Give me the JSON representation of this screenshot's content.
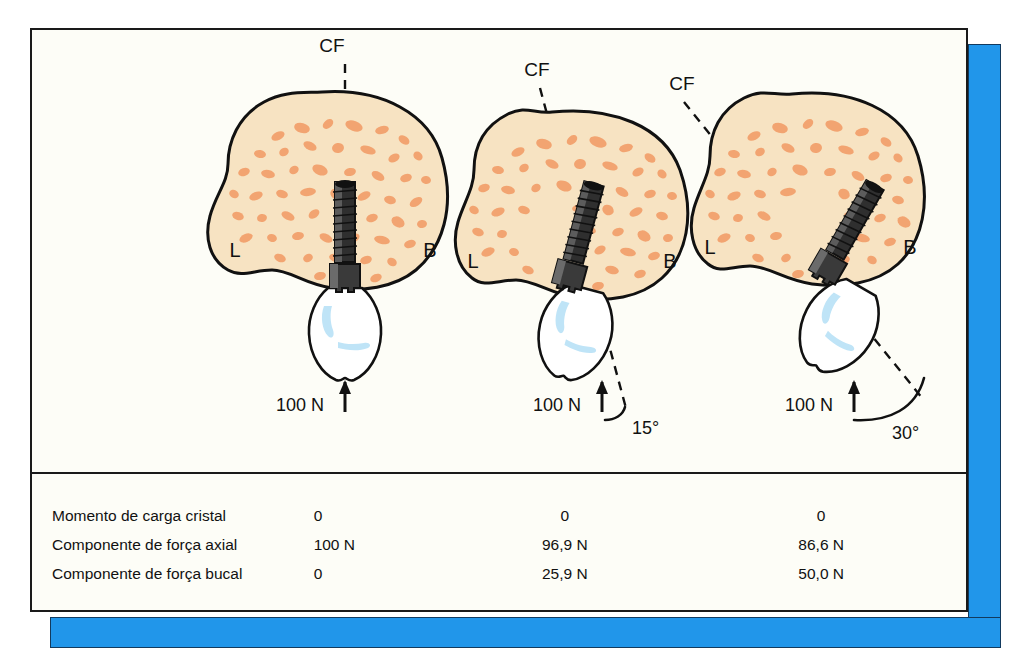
{
  "figure": {
    "frame_color": "#1a1a1a",
    "shadow_color": "#2196ea",
    "bone_color": "#f7e3c2",
    "bone_spot_color": "#f2a471",
    "crown_color": "#ffffff",
    "crown_highlight_color": "#bfe4f7"
  },
  "panels": [
    {
      "id": "panel-0-degrees",
      "cf_label": "CF",
      "lingual_label": "L",
      "buccal_label": "B",
      "force_label": "100 N",
      "angle_label": ""
    },
    {
      "id": "panel-15-degrees",
      "cf_label": "CF",
      "lingual_label": "L",
      "buccal_label": "B",
      "force_label": "100 N",
      "angle_label": "15°"
    },
    {
      "id": "panel-30-degrees",
      "cf_label": "CF",
      "lingual_label": "L",
      "buccal_label": "B",
      "force_label": "100 N",
      "angle_label": "30°"
    }
  ],
  "table": {
    "rows": [
      {
        "label": "Momento de carga cristal",
        "values": [
          "0",
          "0",
          "0"
        ]
      },
      {
        "label": "Componente de força axial",
        "values": [
          "100 N",
          "96,9 N",
          "86,6 N"
        ]
      },
      {
        "label": "Componente de força bucal",
        "values": [
          "0",
          "25,9 N",
          "50,0 N"
        ]
      }
    ]
  }
}
